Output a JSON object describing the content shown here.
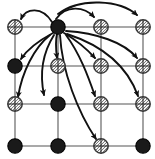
{
  "figure": {
    "width": 155,
    "height": 159,
    "background_color": "#ffffff",
    "grid_line_color": "#8d8d8d",
    "arrow_color": "#111111",
    "solid_node_color": "#1a1a1a",
    "hatched_node_color": "#f2f2f2"
  },
  "chart_data": {
    "type": "diagram",
    "title": "",
    "xlabel": "",
    "ylabel": "",
    "grid": true,
    "legend": "none",
    "lattice": {
      "rows": 4,
      "columns": 4,
      "column_x": [
        15,
        58,
        101,
        143
      ],
      "row_y": [
        27,
        66,
        104,
        146
      ],
      "node_radius": 7.2
    },
    "source_node": "r0c1",
    "nodes": [
      {
        "id": "r0c0",
        "row": 0,
        "col": 0,
        "cx": 15,
        "cy": 27,
        "state": "hatched"
      },
      {
        "id": "r0c1",
        "row": 0,
        "col": 1,
        "cx": 58,
        "cy": 27,
        "state": "solid"
      },
      {
        "id": "r0c2",
        "row": 0,
        "col": 2,
        "cx": 101,
        "cy": 27,
        "state": "hatched"
      },
      {
        "id": "r0c3",
        "row": 0,
        "col": 3,
        "cx": 143,
        "cy": 27,
        "state": "hatched"
      },
      {
        "id": "r1c0",
        "row": 1,
        "col": 0,
        "cx": 15,
        "cy": 66,
        "state": "solid"
      },
      {
        "id": "r1c1",
        "row": 1,
        "col": 1,
        "cx": 58,
        "cy": 66,
        "state": "hatched"
      },
      {
        "id": "r1c2",
        "row": 1,
        "col": 2,
        "cx": 101,
        "cy": 66,
        "state": "hatched"
      },
      {
        "id": "r1c3",
        "row": 1,
        "col": 3,
        "cx": 143,
        "cy": 66,
        "state": "hatched"
      },
      {
        "id": "r2c0",
        "row": 2,
        "col": 0,
        "cx": 15,
        "cy": 104,
        "state": "hatched"
      },
      {
        "id": "r2c1",
        "row": 2,
        "col": 1,
        "cx": 58,
        "cy": 104,
        "state": "solid"
      },
      {
        "id": "r2c2",
        "row": 2,
        "col": 2,
        "cx": 101,
        "cy": 104,
        "state": "hatched"
      },
      {
        "id": "r2c3",
        "row": 2,
        "col": 3,
        "cx": 143,
        "cy": 104,
        "state": "hatched"
      },
      {
        "id": "r3c0",
        "row": 3,
        "col": 0,
        "cx": 15,
        "cy": 146,
        "state": "solid"
      },
      {
        "id": "r3c1",
        "row": 3,
        "col": 1,
        "cx": 58,
        "cy": 146,
        "state": "solid"
      },
      {
        "id": "r3c2",
        "row": 3,
        "col": 2,
        "cx": 101,
        "cy": 146,
        "state": "hatched"
      },
      {
        "id": "r3c3",
        "row": 3,
        "col": 3,
        "cx": 143,
        "cy": 146,
        "state": "solid"
      }
    ],
    "arrows": [
      {
        "id": "a-left-top",
        "from": "r0c1",
        "to": "r0c0",
        "path": "M 52 22 C 42 6, 26 8, 21 19"
      },
      {
        "id": "a-right-top-mid",
        "from": "r0c1",
        "to": "r0c2",
        "path": "M 56 19 C 66 5, 84 6, 94 17"
      },
      {
        "id": "a-right-top-far",
        "from": "r0c1",
        "to": "r0c3",
        "path": "M 58 14 C 80 -3, 120 0, 137 15"
      },
      {
        "id": "a-down-left-r1",
        "from": "r0c1",
        "to": "r1c0",
        "path": "M 53 33 C 40 40, 28 48, 21 59"
      },
      {
        "id": "a-down-mid-r1",
        "from": "r0c1",
        "to": "r1c1",
        "path": "M 57 34 C 55 42, 56 50, 57 58"
      },
      {
        "id": "a-down-right-r1",
        "from": "r0c1",
        "to": "r1c2",
        "path": "M 64 33 C 76 40, 86 48, 95 58"
      },
      {
        "id": "a-down-far-r1",
        "from": "r0c1",
        "to": "r1c3",
        "path": "M 66 31 C 96 33, 124 42, 137 58"
      },
      {
        "id": "a-down-left-r2",
        "from": "r0c1",
        "to": "r2c0",
        "path": "M 50 35 C 34 48, 22 72, 18 97"
      },
      {
        "id": "a-down-mid-r2",
        "from": "r0c1",
        "to": "r2c1",
        "path": "M 54 35 C 42 54, 40 76, 44 95"
      },
      {
        "id": "a-down-rt-r2",
        "from": "r0c1",
        "to": "r2c2",
        "path": "M 66 35 C 80 54, 88 76, 95 96"
      },
      {
        "id": "a-down-far-r2",
        "from": "r0c1",
        "to": "r2c3",
        "path": "M 67 34 C 104 46, 128 68, 138 96"
      },
      {
        "id": "a-down-bottom",
        "from": "r0c1",
        "to": "r3c2",
        "path": "M 60 35 C 62 72, 78 112, 96 139"
      }
    ],
    "arrowhead": {
      "length": 7,
      "width": 5
    }
  }
}
